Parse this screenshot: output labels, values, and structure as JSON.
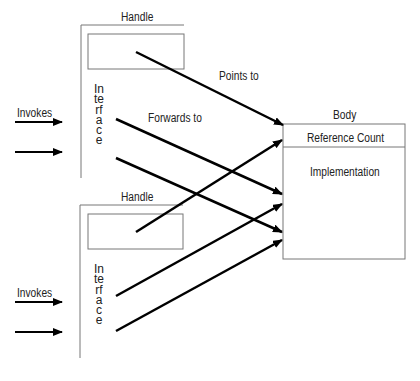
{
  "diagram": {
    "handles": [
      {
        "label": "Handle",
        "interface_label": "Interface",
        "invokes_label": "Invokes"
      },
      {
        "label": "Handle",
        "interface_label": "Interface",
        "invokes_label": "Invokes"
      }
    ],
    "edge_labels": {
      "points_to": "Points to",
      "forwards_to": "Forwards to"
    },
    "body": {
      "label": "Body",
      "sections": [
        "Reference Count",
        "Implementation"
      ]
    },
    "edges": [
      {
        "from": "handle1.box",
        "to": "body",
        "label": "Points to"
      },
      {
        "from": "handle1.interface",
        "to": "body.implementation",
        "label": "Forwards to"
      },
      {
        "from": "handle1.interface",
        "to": "body.implementation"
      },
      {
        "from": "handle2.box",
        "to": "body.reference_count"
      },
      {
        "from": "handle2.interface",
        "to": "body.implementation"
      },
      {
        "from": "handle2.interface",
        "to": "body.implementation"
      }
    ],
    "colors": {
      "line": "#000000",
      "border": "#777777",
      "text": "#222222"
    }
  }
}
